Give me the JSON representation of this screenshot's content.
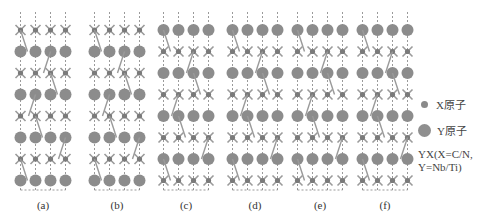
{
  "figure": {
    "panels": [
      {
        "label": "(a)",
        "cx": 43,
        "top": "X",
        "bottom": "X"
      },
      {
        "label": "(b)",
        "cx": 117,
        "top": "Yapex",
        "bottom": "Xapex"
      },
      {
        "label": "(c)",
        "cx": 186,
        "top": "Yapex",
        "bottom": "Yapex"
      },
      {
        "label": "(d)",
        "cx": 255,
        "top": "Y",
        "bottom": "Y"
      },
      {
        "label": "(e)",
        "cx": 320,
        "top": "Yapex",
        "bottom": "Yapex"
      },
      {
        "label": "(f)",
        "cx": 385,
        "top": "Yapex",
        "bottom": "Yapex"
      }
    ],
    "legend": {
      "x_atom": "X原子",
      "y_atom": "Y原子",
      "note_line1": "YX(X=C/N,",
      "note_line2": "Y=Nb/Ti)"
    },
    "colors": {
      "atom": "#8c8c8c",
      "bond": "#9a9a9a",
      "dash": "#555555"
    }
  }
}
